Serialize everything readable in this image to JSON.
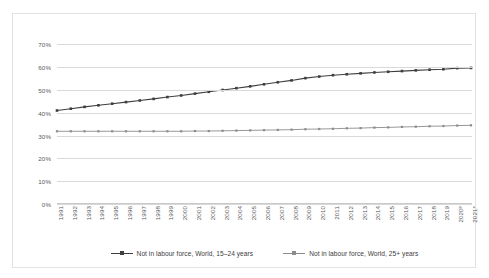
{
  "chart_data": {
    "type": "line",
    "title": "",
    "subtitle": "",
    "xlabel": "",
    "ylabel": "",
    "ylim": [
      0,
      75
    ],
    "ytick_values": [
      0,
      10,
      20,
      30,
      40,
      50,
      60,
      70
    ],
    "ytick_labels": [
      "0%",
      "10%",
      "20%",
      "30%",
      "40%",
      "50%",
      "60%",
      "70%"
    ],
    "grid": true,
    "legend_position": "bottom",
    "categories": [
      "1991",
      "1992",
      "1993",
      "1994",
      "1995",
      "1996",
      "1997",
      "1998",
      "1999",
      "2000",
      "2001",
      "2002",
      "2003",
      "2004",
      "2005",
      "2006",
      "2007",
      "2008",
      "2009",
      "2010",
      "2011",
      "2012",
      "2013",
      "2014",
      "2015",
      "2016",
      "2017",
      "2018",
      "2019",
      "2020ᵖ",
      "2021*"
    ],
    "series": [
      {
        "name": "Not in labour force, World, 15–24 years",
        "color": "#3f3f3f",
        "marker": "square",
        "values": [
          41.0,
          41.8,
          42.6,
          43.3,
          44.0,
          44.7,
          45.4,
          46.1,
          46.9,
          47.6,
          48.4,
          49.2,
          50.0,
          50.8,
          51.6,
          52.5,
          53.4,
          54.2,
          55.2,
          55.9,
          56.5,
          56.9,
          57.3,
          57.7,
          58.0,
          58.3,
          58.6,
          58.9,
          59.1,
          59.6,
          59.7
        ]
      },
      {
        "name": "Not in labour force, World, 25+ years",
        "color": "#8c8c8c",
        "marker": "square",
        "values": [
          31.9,
          31.9,
          31.9,
          31.9,
          31.9,
          31.9,
          31.9,
          31.9,
          31.9,
          31.9,
          32.0,
          32.0,
          32.1,
          32.2,
          32.3,
          32.4,
          32.5,
          32.6,
          32.8,
          32.9,
          33.0,
          33.2,
          33.3,
          33.5,
          33.6,
          33.8,
          33.9,
          34.1,
          34.2,
          34.4,
          34.5
        ]
      }
    ],
    "legend": [
      "Not in labour force, World, 15–24 years",
      "Not in labour force, World, 25+ years"
    ]
  },
  "colors": {
    "series1": "#3f3f3f",
    "series2": "#8c8c8c",
    "grid": "#d9d9d9",
    "border": "#e2e2e2",
    "text": "#595959"
  }
}
